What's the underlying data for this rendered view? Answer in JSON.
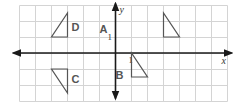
{
  "diagram": {
    "type": "coordinate-plane",
    "grid": {
      "cols": 13,
      "rows": 6,
      "cell_px": 16,
      "left_px": 19.5,
      "top_px": 5.5,
      "origin_px": [
        115.5,
        53
      ],
      "x_range": [
        -6,
        7
      ],
      "y_range": [
        -3,
        3
      ]
    },
    "axes": {
      "x_label": "x",
      "y_label": "y",
      "x_tick_label": "1",
      "y_tick_label": "1"
    },
    "colors": {
      "grid": "#d4d4d4",
      "axis": "#1a1a1a",
      "shape": "#555555"
    },
    "triangles": [
      {
        "label": "A",
        "vertices": [
          [
            3,
            2.5
          ],
          [
            3,
            1
          ],
          [
            4,
            1
          ]
        ],
        "label_pos": [
          -0.75,
          1.5
        ]
      },
      {
        "label": "B",
        "vertices": [
          [
            1,
            0
          ],
          [
            1,
            -1.5
          ],
          [
            2,
            -1.5
          ]
        ],
        "label_pos": [
          0.25,
          -1.35
        ]
      },
      {
        "label": "C",
        "vertices": [
          [
            -4,
            -1
          ],
          [
            -3,
            -1
          ],
          [
            -3,
            -2.5
          ]
        ],
        "label_pos": [
          -2.5,
          -1.65
        ]
      },
      {
        "label": "D",
        "vertices": [
          [
            -4,
            1
          ],
          [
            -3,
            1
          ],
          [
            -3,
            2.5
          ]
        ],
        "label_pos": [
          -2.5,
          1.6
        ]
      }
    ]
  }
}
